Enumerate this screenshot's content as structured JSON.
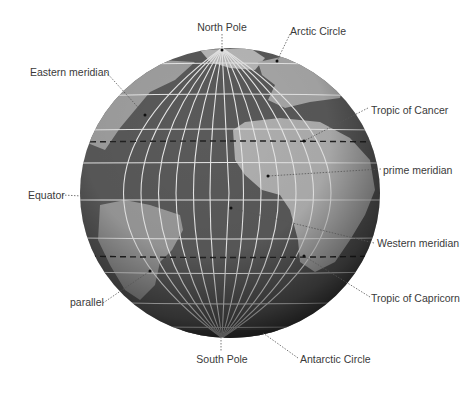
{
  "colors": {
    "ocean": "#5a5a5a",
    "land": "#a8a8a8",
    "grid": "#e8e8e8",
    "label_text": "#3a3a3a",
    "background": "#ffffff"
  },
  "labels": {
    "north_pole": "North Pole",
    "arctic_circle": "Arctic Circle",
    "eastern_meridian": "Eastern meridian",
    "tropic_of_cancer": "Tropic of Cancer",
    "prime_meridian": "prime meridian",
    "equator": "Equator",
    "western_meridian": "Western meridian",
    "tropic_of_capricorn": "Tropic of Capricorn",
    "parallel": "parallel",
    "south_pole": "South Pole",
    "antarctic_circle": "Antarctic Circle"
  }
}
